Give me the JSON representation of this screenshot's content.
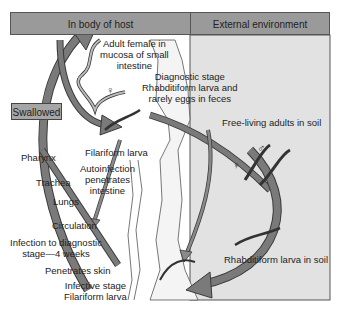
{
  "header": {
    "host_label": "In body of host",
    "external_label": "External environment"
  },
  "labels": {
    "adult_female": [
      "Adult female in",
      "mucosa of small",
      "intestine"
    ],
    "diagnostic": [
      "Diagnostic stage",
      "Rhabditiform larva and",
      "rarely eggs in feces"
    ],
    "free_living": "Free-living adults in soil",
    "swallowed": "Swallowed",
    "filariform": "Filariform larva",
    "autoinfection": [
      "Autoinfection",
      "penetrates",
      "intestine"
    ],
    "pharynx": "Pharynx",
    "trachea": "Trachea",
    "lungs": "Lungs",
    "circulation": "Circulation",
    "infection_time": [
      "Infection to diagnostic",
      "stage—4 weeks"
    ],
    "penetrates_skin": "Penetrates skin",
    "rhabditiform_soil": "Rhabditiform larva in soil",
    "infective": [
      "Infective stage",
      "Filariform larva"
    ],
    "female_symbol": "♀",
    "male_symbol": "♂"
  },
  "colors": {
    "header_fill": "#9a9a9a",
    "external_fill": "#e2e2e2",
    "arrow_fill": "#6e6e6e",
    "arrow_edge": "#3a3a3a"
  }
}
